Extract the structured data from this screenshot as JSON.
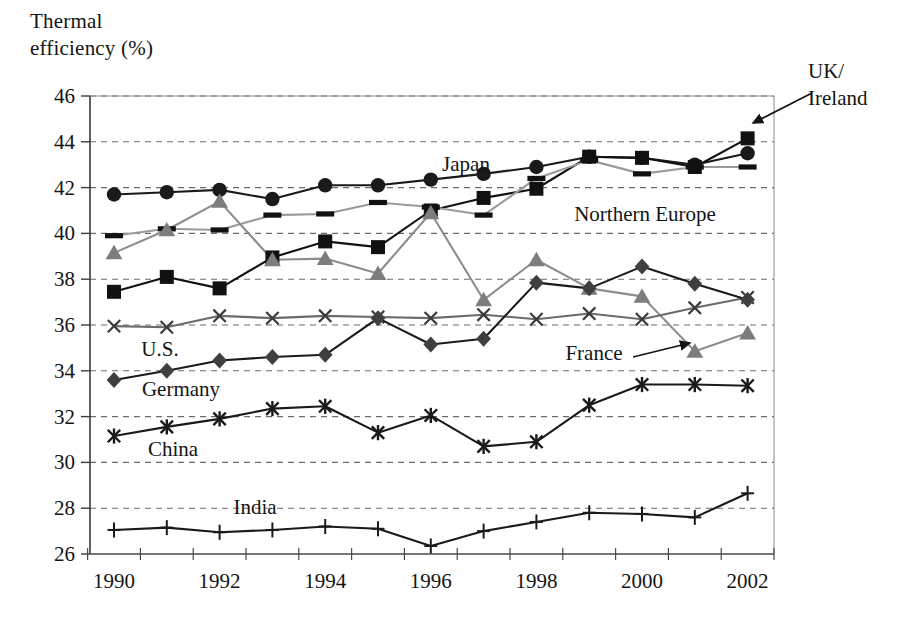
{
  "axis_title": "Thermal\nefficiency (%)",
  "chart_data": {
    "type": "line",
    "title": "Thermal efficiency (%)",
    "xlabel": "",
    "ylabel": "Thermal efficiency (%)",
    "ylim": [
      26,
      46
    ],
    "ytick_step": 2,
    "yticks": [
      26,
      28,
      30,
      32,
      34,
      36,
      38,
      40,
      42,
      44,
      46
    ],
    "x": [
      1990,
      1991,
      1992,
      1993,
      1994,
      1995,
      1996,
      1997,
      1998,
      1999,
      2000,
      2001,
      2002
    ],
    "xticks": [
      1990,
      1992,
      1994,
      1996,
      1998,
      2000,
      2002
    ],
    "xtick_labels": [
      "1990",
      "1992",
      "1994",
      "1996",
      "1998",
      "2000",
      "2002"
    ],
    "grid": "horizontal-dashed",
    "legend": "inline-annotations",
    "series": [
      {
        "name": "Japan",
        "marker": "circle",
        "color": "#1a1a1a",
        "line_color": "#1a1a1a",
        "values": [
          41.7,
          41.8,
          41.9,
          41.5,
          42.1,
          42.1,
          42.35,
          42.6,
          42.9,
          43.35,
          43.3,
          43.0,
          43.5
        ]
      },
      {
        "name": "UK/Ireland",
        "marker": "square",
        "color": "#111111",
        "line_color": "#111111",
        "values": [
          37.45,
          38.1,
          37.6,
          38.95,
          39.65,
          39.4,
          41.0,
          41.55,
          41.95,
          43.35,
          43.3,
          42.9,
          44.15
        ]
      },
      {
        "name": "Northern Europe",
        "marker": "dash",
        "color": "#111111",
        "line_color": "#9a9a9a",
        "values": [
          39.9,
          40.2,
          40.15,
          40.8,
          40.85,
          41.35,
          41.15,
          40.8,
          42.4,
          43.2,
          42.6,
          42.9,
          42.9
        ]
      },
      {
        "name": "France",
        "marker": "triangle",
        "color": "#7d7d7d",
        "line_color": "#8d8d8d",
        "values": [
          39.15,
          40.15,
          41.4,
          38.85,
          38.9,
          38.25,
          40.9,
          37.1,
          38.85,
          37.6,
          37.25,
          34.85,
          35.65
        ]
      },
      {
        "name": "U.S.",
        "marker": "cross-x",
        "color": "#3a3a3a",
        "line_color": "#6b6b6b",
        "values": [
          35.95,
          35.9,
          36.4,
          36.3,
          36.4,
          36.35,
          36.3,
          36.45,
          36.25,
          36.5,
          36.25,
          36.75,
          37.2
        ]
      },
      {
        "name": "Germany",
        "marker": "diamond",
        "color": "#3f3f3f",
        "line_color": "#1a1a1a",
        "values": [
          33.6,
          34.0,
          34.45,
          34.6,
          34.7,
          36.3,
          35.15,
          35.4,
          37.85,
          37.6,
          38.55,
          37.8,
          37.1
        ]
      },
      {
        "name": "China",
        "marker": "star",
        "color": "#1a1a1a",
        "line_color": "#1a1a1a",
        "values": [
          31.15,
          31.55,
          31.9,
          32.35,
          32.45,
          31.3,
          32.05,
          30.7,
          30.9,
          32.5,
          33.4,
          33.4,
          33.35
        ]
      },
      {
        "name": "India",
        "marker": "plus",
        "color": "#1a1a1a",
        "line_color": "#1a1a1a",
        "values": [
          27.05,
          27.15,
          26.95,
          27.05,
          27.2,
          27.1,
          26.35,
          27.0,
          27.4,
          27.8,
          27.75,
          27.6,
          28.65
        ]
      }
    ],
    "annotations": [
      {
        "id": "japan",
        "text": "Japan",
        "x_px": 466,
        "y_px": 171,
        "anchor": "middle",
        "arrow": false
      },
      {
        "id": "northern-europe",
        "text": "Northern Europe",
        "x_px": 645,
        "y_px": 221,
        "anchor": "middle",
        "arrow": false
      },
      {
        "id": "uk-ireland",
        "text": "UK/\nIreland",
        "x_px": 808,
        "y_px": 78,
        "anchor": "start",
        "arrow": true,
        "arrow_x1": 812,
        "arrow_y1": 93,
        "arrow_x2": 753,
        "arrow_y2": 123
      },
      {
        "id": "france",
        "text": "France",
        "x_px": 594,
        "y_px": 360,
        "anchor": "middle",
        "arrow": true,
        "arrow_x1": 633,
        "arrow_y1": 357,
        "arrow_x2": 690,
        "arrow_y2": 343
      },
      {
        "id": "us",
        "text": "U.S.",
        "x_px": 160,
        "y_px": 356,
        "anchor": "middle",
        "arrow": false
      },
      {
        "id": "germany",
        "text": "Germany",
        "x_px": 181,
        "y_px": 396,
        "anchor": "middle",
        "arrow": false
      },
      {
        "id": "china",
        "text": "China",
        "x_px": 173,
        "y_px": 456,
        "anchor": "middle",
        "arrow": false
      },
      {
        "id": "india",
        "text": "India",
        "x_px": 255,
        "y_px": 514,
        "anchor": "middle",
        "arrow": false
      }
    ]
  },
  "plot_geometry": {
    "left": 90,
    "right": 774,
    "top": 96,
    "bottom": 554,
    "x_first": 114,
    "x_step": 52.8
  }
}
